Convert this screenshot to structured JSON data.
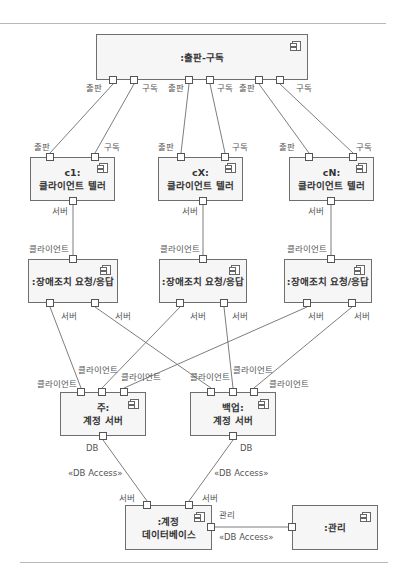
{
  "diagram": {
    "type": "UML component diagram",
    "stroke_color": "#6e6e6e",
    "box_fill": "#f6f6f6"
  },
  "components": {
    "pubsub": {
      "label": ":출판-구독"
    },
    "c1": {
      "line1": "c1:",
      "line2": "클라이언트 텔러"
    },
    "cx": {
      "line1": "cX:",
      "line2": "클라이언트 텔러"
    },
    "cn": {
      "line1": "cN:",
      "line2": "클라이언트 텔러"
    },
    "failover1": {
      "label": ":장애조치 요청/응답"
    },
    "failover2": {
      "label": ":장애조치 요청/응답"
    },
    "failover3": {
      "label": ":장애조치 요청/응답"
    },
    "primary": {
      "line1": "주:",
      "line2": "계정 서버"
    },
    "backup": {
      "line1": "백업:",
      "line2": "계정 서버"
    },
    "database": {
      "line1": ":계정",
      "line2": "데이터베이스"
    },
    "admin": {
      "label": ":관리"
    }
  },
  "port_labels": {
    "publish": "출판",
    "subscribe": "구독",
    "server": "서버",
    "client": "클라이언트",
    "db": "DB",
    "admin": "관리"
  },
  "connector_labels": {
    "db_access": "«DB Access»"
  },
  "icons": {
    "component": "uml-component-icon"
  }
}
